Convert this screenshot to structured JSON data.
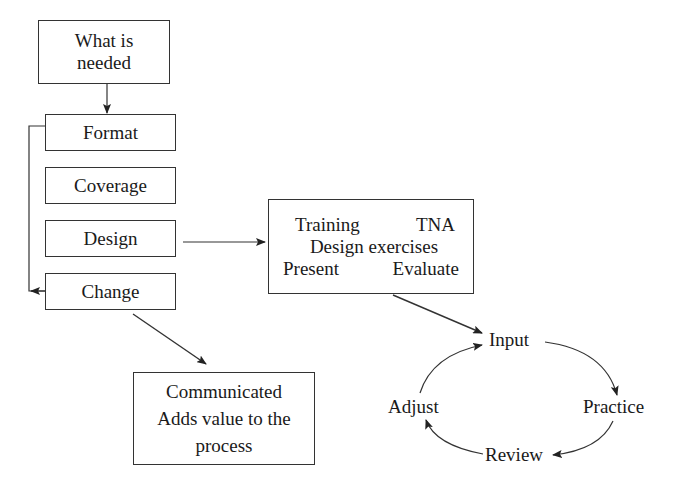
{
  "diagram": {
    "left_column": {
      "top_box": {
        "line1": "What is",
        "line2": "needed"
      },
      "items": [
        {
          "label": "Format"
        },
        {
          "label": "Coverage"
        },
        {
          "label": "Design"
        },
        {
          "label": "Change"
        }
      ]
    },
    "training_box": {
      "row1_left": "Training",
      "row1_right": "TNA",
      "row2": "Design exercises",
      "row3_left": "Present",
      "row3_right": "Evaluate"
    },
    "outcome_box": {
      "line1": "Communicated",
      "line2": "Adds value to the",
      "line3": "process"
    },
    "cycle": {
      "nodes": [
        {
          "label": "Input"
        },
        {
          "label": "Practice"
        },
        {
          "label": "Review"
        },
        {
          "label": "Adjust"
        }
      ]
    },
    "colors": {
      "stroke": "#333333",
      "text": "#1a1a1a",
      "background": "#ffffff"
    }
  }
}
